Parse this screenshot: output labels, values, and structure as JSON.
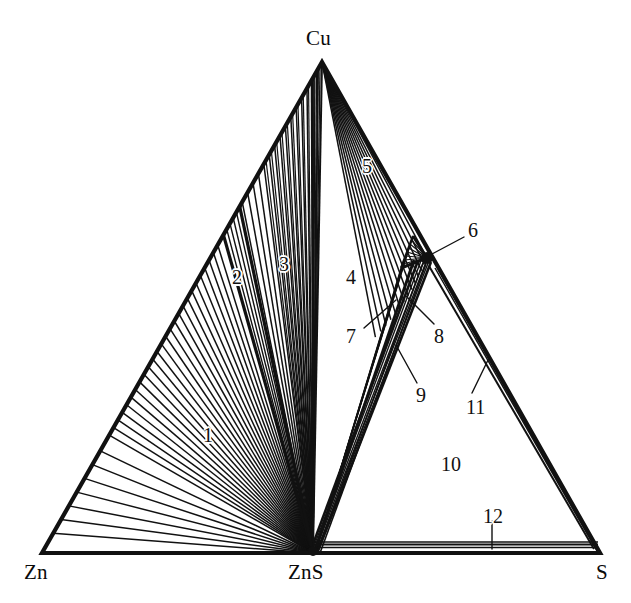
{
  "figure": {
    "kind": "ternary-phase-diagram",
    "system": "Cu-Zn-S",
    "width": 631,
    "height": 603,
    "background_color": "#ffffff",
    "line_color": "#111111"
  },
  "vertices": [
    {
      "id": "cu",
      "label": "Cu",
      "x": 322,
      "y": 62,
      "label_x": 306,
      "label_y": 26
    },
    {
      "id": "zn",
      "label": "Zn",
      "x": 42,
      "y": 553,
      "label_x": 24,
      "label_y": 560
    },
    {
      "id": "s",
      "label": "S",
      "x": 600,
      "y": 553,
      "label_x": 596,
      "label_y": 560
    }
  ],
  "interior_points": [
    {
      "id": "zns",
      "label": "ZnS",
      "x": 313,
      "y": 553,
      "label_x": 288,
      "label_y": 560
    },
    {
      "id": "node6",
      "label": "",
      "x": 427,
      "y": 258
    }
  ],
  "region_labels": [
    {
      "id": "1",
      "text": "1",
      "x": 203,
      "y": 424,
      "leader": null
    },
    {
      "id": "2",
      "text": "2",
      "x": 232,
      "y": 266,
      "leader": null
    },
    {
      "id": "3",
      "text": "3",
      "x": 279,
      "y": 253,
      "leader": null
    },
    {
      "id": "4",
      "text": "4",
      "x": 346,
      "y": 266,
      "leader": null
    },
    {
      "id": "5",
      "text": "5",
      "x": 362,
      "y": 155,
      "leader": null
    },
    {
      "id": "6",
      "text": "6",
      "x": 468,
      "y": 219,
      "leader": {
        "x1": 464,
        "y1": 237,
        "x2": 432,
        "y2": 254
      }
    },
    {
      "id": "7",
      "text": "7",
      "x": 346,
      "y": 325,
      "leader": {
        "x1": 364,
        "y1": 328,
        "x2": 396,
        "y2": 300
      }
    },
    {
      "id": "8",
      "text": "8",
      "x": 434,
      "y": 325,
      "leader": {
        "x1": 434,
        "y1": 324,
        "x2": 406,
        "y2": 296
      }
    },
    {
      "id": "9",
      "text": "9",
      "x": 416,
      "y": 384,
      "leader": {
        "x1": 417,
        "y1": 383,
        "x2": 396,
        "y2": 345
      }
    },
    {
      "id": "10",
      "text": "10",
      "x": 441,
      "y": 453,
      "leader": null
    },
    {
      "id": "11",
      "text": "11",
      "x": 466,
      "y": 396,
      "leader": {
        "x1": 472,
        "y1": 393,
        "x2": 489,
        "y2": 358
      }
    },
    {
      "id": "12",
      "text": "12",
      "x": 483,
      "y": 505,
      "leader": {
        "x1": 492,
        "y1": 521,
        "x2": 492,
        "y2": 549
      }
    }
  ],
  "chart_data": {
    "type": "ternary-tieline-diagram",
    "title": "",
    "corners": {
      "top": "Cu",
      "bottom_left": "Zn",
      "bottom_right": "S"
    },
    "compound_on_base": "ZnS",
    "invariant_node_on_cu_s_edge": "6",
    "numbered_regions": [
      "1",
      "2",
      "3",
      "4",
      "5",
      "6",
      "7",
      "8",
      "9",
      "10",
      "11",
      "12"
    ],
    "region_notes": {
      "1": "wide tie-line fan from ZnS to Zn-Cu edge (lower part)",
      "2": "narrow wedge bounded by heavy lines, ZnS to Zn-Cu edge",
      "3": "dense tie-line fan from ZnS toward upper Zn-Cu edge",
      "4": "open region between ZnS-Cu line and ZnS-node6 band",
      "5": "narrow tie-line fan from Cu apex toward Cu-S edge",
      "6": "small triangular node region on Cu-S edge",
      "7": "narrow band from ZnS up to node 6 (left side)",
      "8": "narrow band from ZnS up to node 6 (right side)",
      "9": "narrow band from ZnS up to node 6 (inner)",
      "10": "open region ZnS-node6-S",
      "11": "narrow band along node6-S edge",
      "12": "narrow band along ZnS-S base"
    },
    "fan_line_counts": {
      "region_1": 26,
      "region_2": 4,
      "region_3": 14,
      "region_5": 13
    },
    "grid": false,
    "legend_position": "none"
  }
}
